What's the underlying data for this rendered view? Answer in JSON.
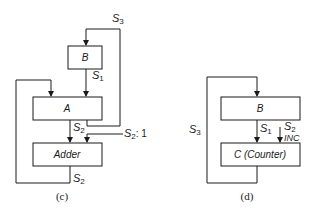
{
  "diagrams": [
    {
      "caption": "(c)",
      "boxes": {
        "b": "B",
        "a": "A",
        "adder": "Adder"
      },
      "signals": {
        "s3": {
          "base": "S",
          "sub": "3"
        },
        "s1": {
          "base": "S",
          "sub": "1"
        },
        "s2_mid": {
          "base": "S",
          "sub": "2"
        },
        "s2_one": {
          "base": "S",
          "sub": "2",
          "suffix": ": 1"
        },
        "s2_bottom": {
          "base": "S",
          "sub": "2"
        }
      }
    },
    {
      "caption": "(d)",
      "boxes": {
        "b": "B",
        "c": "C (Counter)"
      },
      "signals": {
        "s3": {
          "base": "S",
          "sub": "3"
        },
        "s1": {
          "base": "S",
          "sub": "1"
        },
        "s2": {
          "base": "S",
          "sub": "2"
        },
        "inc": "INC"
      }
    }
  ],
  "colors": {
    "line": "#1a1a1a",
    "background": "#ffffff"
  }
}
